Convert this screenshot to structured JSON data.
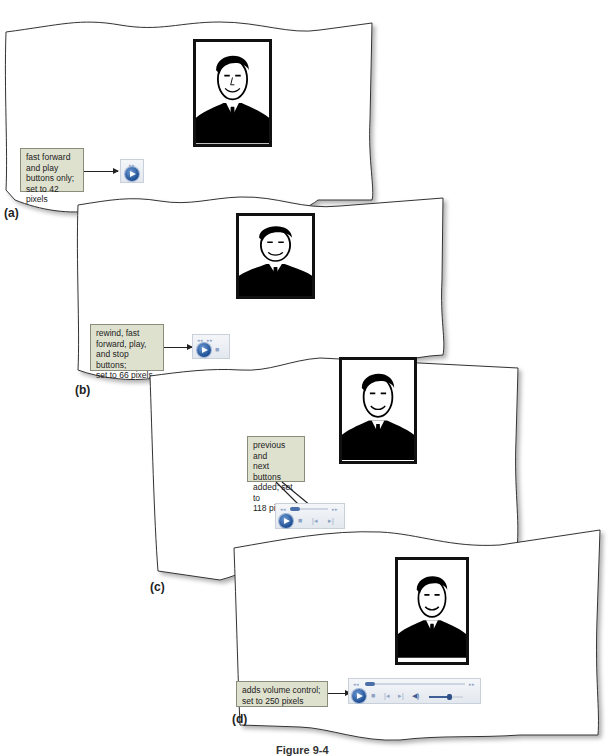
{
  "figure": {
    "caption": "Figure 9-4"
  },
  "panels": [
    {
      "label": "(a)",
      "callout": [
        "fast forward",
        "and play",
        "buttons only;",
        "set to 42 pixels"
      ],
      "player_width_px": 42,
      "controls": [
        "fast-forward",
        "play"
      ]
    },
    {
      "label": "(b)",
      "callout": [
        "rewind, fast",
        "forward, play,",
        "and stop buttons;",
        "set to 66 pixels"
      ],
      "player_width_px": 66,
      "controls": [
        "rewind",
        "fast-forward",
        "play",
        "stop"
      ]
    },
    {
      "label": "(c)",
      "callout": [
        "previous and",
        "next buttons",
        "added; set to",
        "118 pixels"
      ],
      "player_width_px": 118,
      "controls": [
        "rewind",
        "seek",
        "fast-forward",
        "play",
        "stop",
        "previous",
        "next"
      ]
    },
    {
      "label": "(d)",
      "callout": [
        "adds volume control;",
        "set to 250 pixels"
      ],
      "player_width_px": 250,
      "controls": [
        "rewind",
        "seek",
        "fast-forward",
        "play",
        "stop",
        "previous",
        "next",
        "mute",
        "volume"
      ]
    }
  ],
  "glyphs": {
    "rewind": "◂◂",
    "fast_forward": "▸▸",
    "stop": "■",
    "previous": "|◂",
    "next": "▸|",
    "speaker": "◀)"
  },
  "colors": {
    "callout_bg": "#dfe1cf",
    "player_accent": "#1c4c92"
  }
}
